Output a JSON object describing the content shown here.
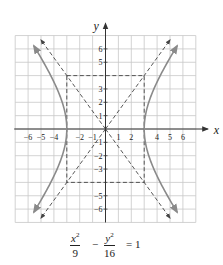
{
  "chart_data": {
    "type": "line",
    "title": "",
    "equation": "x^2/9 - y^2/16 = 1",
    "xlabel": "x",
    "ylabel": "y",
    "xlim": [
      -7,
      7
    ],
    "ylim": [
      -7,
      7
    ],
    "grid": true,
    "x_tick_labels": [
      "-6",
      "-5",
      "-4",
      "-2",
      "-1",
      "1",
      "2",
      "4",
      "5",
      "6"
    ],
    "y_tick_labels": [
      "6",
      "5",
      "3",
      "2",
      "1",
      "-1",
      "-2",
      "-3",
      "-5",
      "-6"
    ],
    "series": [
      {
        "name": "hyperbola right branch",
        "style": "solid",
        "vertex": [
          3,
          0
        ],
        "x": [
          3,
          3.5,
          4,
          4.5,
          5,
          5.5
        ],
        "y_upper": [
          0,
          2.4,
          3.53,
          4.47,
          5.33,
          6.15
        ],
        "y_lower": [
          0,
          -2.4,
          -3.53,
          -4.47,
          -5.33,
          -6.15
        ]
      },
      {
        "name": "hyperbola left branch",
        "style": "solid",
        "vertex": [
          -3,
          0
        ],
        "x": [
          -3,
          -3.5,
          -4,
          -4.5,
          -5,
          -5.5
        ],
        "y_upper": [
          0,
          2.4,
          3.53,
          4.47,
          5.33,
          6.15
        ],
        "y_lower": [
          0,
          -2.4,
          -3.53,
          -4.47,
          -5.33,
          -6.15
        ]
      },
      {
        "name": "asymptote y = 4x/3",
        "style": "dashed",
        "x": [
          -5,
          5
        ],
        "y": [
          -6.67,
          6.67
        ]
      },
      {
        "name": "asymptote y = -4x/3",
        "style": "dashed",
        "x": [
          -5,
          5
        ],
        "y": [
          6.67,
          -6.67
        ]
      },
      {
        "name": "fundamental rectangle",
        "style": "dashed",
        "corners": [
          [
            -3,
            4
          ],
          [
            3,
            4
          ],
          [
            3,
            -4
          ],
          [
            -3,
            -4
          ]
        ]
      }
    ]
  },
  "labels": {
    "x_axis": "x",
    "y_axis": "y",
    "x_ticks": [
      {
        "v": -6,
        "t": "−6"
      },
      {
        "v": -5,
        "t": "−5"
      },
      {
        "v": -4,
        "t": "−4"
      },
      {
        "v": -2,
        "t": "−2"
      },
      {
        "v": -1,
        "t": "−1"
      },
      {
        "v": 1,
        "t": "1"
      },
      {
        "v": 2,
        "t": "2"
      },
      {
        "v": 4,
        "t": "4"
      },
      {
        "v": 5,
        "t": "5"
      },
      {
        "v": 6,
        "t": "6"
      }
    ],
    "y_ticks": [
      {
        "v": 6,
        "t": "6"
      },
      {
        "v": 5,
        "t": "5"
      },
      {
        "v": 3,
        "t": "3"
      },
      {
        "v": 2,
        "t": "2"
      },
      {
        "v": 1,
        "t": "1"
      },
      {
        "v": -1,
        "t": "−1"
      },
      {
        "v": -2,
        "t": "−2"
      },
      {
        "v": -3,
        "t": "−3"
      },
      {
        "v": -5,
        "t": "−5"
      },
      {
        "v": -6,
        "t": "−6"
      }
    ]
  },
  "equation": {
    "frac1_num": "x",
    "frac1_den": "9",
    "minus": "−",
    "frac2_num": "y",
    "frac2_den": "16",
    "equals": "= 1",
    "exp": "2"
  },
  "colors": {
    "grid": "#c8c8c8",
    "axis": "#333333",
    "curve": "#8a8a8a",
    "dashed": "#444444",
    "text": "#222222"
  }
}
